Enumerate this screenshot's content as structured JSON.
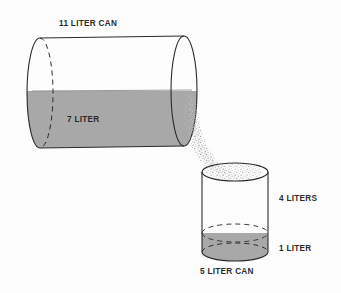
{
  "diagram": {
    "title": "11 LITER CAN",
    "big_can": {
      "capacity_label": "11 LITER CAN",
      "contents_label": "7 LITER",
      "capacity_liters": 11,
      "contents_liters": 7
    },
    "small_can": {
      "capacity_label": "5 LITER CAN",
      "headroom_label": "4 LITERS",
      "contents_label": "1 LITER",
      "capacity_liters": 5,
      "contents_liters": 1,
      "headroom_liters": 4
    },
    "pour": {
      "direction": "big-can-to-small-can",
      "style": "speckled-stream"
    },
    "colors": {
      "liquid_fill": "#a8a8a8",
      "outline": "#2b2b2b",
      "background": "#fdfdfd",
      "speckle": "#b5b5b5",
      "text": "#2b2b2b"
    }
  }
}
